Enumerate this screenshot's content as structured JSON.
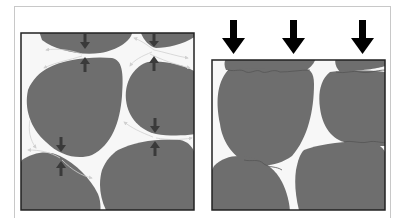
{
  "figure": {
    "colors": {
      "grain": "#6e6e6e",
      "grain_edge": "#8a8a8a",
      "pore": "#f7f7f7",
      "frame": "#222222",
      "outer_frame": "#c8c8c8",
      "force_arrow": "#3a3a3a",
      "load_arrow": "#000000",
      "flow_arrow": "#d0d0d0"
    },
    "left_panel": {
      "label": "",
      "contact_force_arrow_pairs": 4,
      "flow_arrows": true
    },
    "right_panel": {
      "label": "",
      "load_arrows": 3,
      "sutured_contacts": true
    }
  }
}
